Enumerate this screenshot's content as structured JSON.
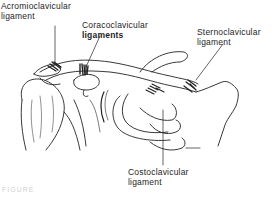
{
  "diagram": {
    "labels": [
      {
        "id": "acromioclavicular",
        "line1": "Acromioclavicular",
        "line2": "ligament"
      },
      {
        "id": "coracoclavicular",
        "line1": "Coracoclavicular",
        "line2": "ligaments"
      },
      {
        "id": "sternoclavicular",
        "line1": "Sternoclavicular",
        "line2": "ligament"
      },
      {
        "id": "costoclavicular",
        "line1": "Costoclavicular",
        "line2": "ligament"
      }
    ],
    "caption": "FIGURE"
  }
}
